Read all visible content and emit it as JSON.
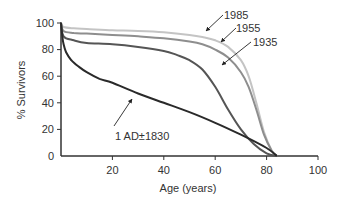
{
  "chart_data": {
    "type": "line",
    "title": "",
    "xlabel": "Age (years)",
    "ylabel": "% Survivors",
    "xlim": [
      0,
      100
    ],
    "ylim": [
      0,
      100
    ],
    "xticks": [
      20,
      40,
      60,
      80,
      100
    ],
    "yticks": [
      0,
      20,
      40,
      60,
      80,
      100
    ],
    "grid": false,
    "legend": "inline arrow annotations",
    "series": [
      {
        "name": "1985",
        "color": "#c4c4c4",
        "x": [
          0,
          1,
          5,
          10,
          20,
          30,
          40,
          50,
          55,
          60,
          65,
          70,
          73,
          76,
          79,
          82,
          84
        ],
        "y": [
          100,
          97,
          96,
          95.5,
          94.5,
          94,
          93,
          91,
          89.5,
          87,
          82,
          72,
          60,
          40,
          18,
          4,
          0
        ]
      },
      {
        "name": "1955",
        "color": "#8e8e8e",
        "x": [
          0,
          1,
          5,
          10,
          20,
          30,
          40,
          50,
          55,
          60,
          65,
          70,
          73,
          76,
          79,
          82,
          84
        ],
        "y": [
          100,
          94,
          92.5,
          92,
          91,
          90,
          88.5,
          86,
          84,
          80,
          74,
          63,
          52,
          35,
          16,
          4,
          0
        ]
      },
      {
        "name": "1935",
        "color": "#555555",
        "x": [
          0,
          1,
          5,
          10,
          20,
          30,
          40,
          45,
          50,
          55,
          60,
          65,
          70,
          75,
          80,
          84
        ],
        "y": [
          100,
          90,
          87,
          85,
          84,
          82,
          79,
          76,
          72,
          65,
          52,
          35,
          20,
          9,
          2,
          0
        ]
      },
      {
        "name": "1 AD±1830",
        "color": "#2a2a2a",
        "x": [
          0,
          0.5,
          1,
          2,
          4,
          7,
          10,
          15,
          20,
          30,
          40,
          50,
          60,
          70,
          80,
          84
        ],
        "y": [
          100,
          90,
          84,
          78,
          72,
          67,
          63,
          58,
          55,
          47,
          40,
          33,
          25,
          16,
          6,
          0
        ]
      }
    ],
    "annotations": [
      {
        "text": "1985",
        "arrow_to": [
          39,
          94
        ]
      },
      {
        "text": "1955",
        "arrow_to": [
          47,
          88
        ]
      },
      {
        "text": "1935",
        "arrow_to": [
          50,
          72
        ]
      },
      {
        "text": "1 AD±1830",
        "arrow_to": [
          27,
          50
        ]
      }
    ]
  },
  "labels": {
    "ylabel": "% Survivors",
    "xlabel": "Age (years)",
    "y0": "0",
    "y20": "20",
    "y40": "40",
    "y60": "60",
    "y80": "80",
    "y100": "100",
    "x20": "20",
    "x40": "40",
    "x60": "60",
    "x80": "80",
    "x100": "100",
    "ann1985": "1985",
    "ann1955": "1955",
    "ann1935": "1935",
    "ann1ad": "1 AD±1830"
  }
}
